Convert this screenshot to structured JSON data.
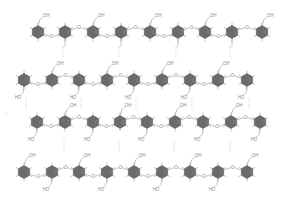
{
  "diagram": {
    "type": "chemical-structure",
    "colors": {
      "ring_fill": "#6b6b6b",
      "bond": "#b0b0b0",
      "label": "#8a8a8a",
      "background": "#ffffff"
    },
    "labels": {
      "hydroxyl_up": "OH",
      "hydroxyl_down": "HO",
      "ether_oxygen": "O",
      "ring_oxygen": "O"
    },
    "rows": [
      {
        "id": "row-1",
        "y": 32,
        "ring_x": [
          38,
          65,
          93,
          121,
          150,
          178,
          205,
          232,
          262
        ],
        "oh_positions": [
          0,
          2,
          4,
          6,
          8
        ],
        "oh_side": "top",
        "link_down_at": [
          1,
          3,
          5,
          7
        ]
      },
      {
        "id": "row-2",
        "y": 80,
        "ring_x": [
          24,
          52,
          79,
          107,
          134,
          162,
          190,
          218,
          247
        ],
        "oh_positions": [
          1,
          3,
          5,
          7
        ],
        "oh_side": "top",
        "ho_positions": [
          0,
          2,
          4,
          6,
          8
        ]
      },
      {
        "id": "row-3",
        "y": 122,
        "ring_x": [
          37,
          65,
          93,
          120,
          147,
          175,
          203,
          231,
          260
        ],
        "oh_positions": [
          1,
          3,
          5,
          7
        ],
        "oh_side": "top",
        "ho_positions": [
          0,
          2,
          4,
          6,
          8
        ]
      },
      {
        "id": "row-4",
        "y": 172,
        "ring_x": [
          24,
          52,
          79,
          107,
          134,
          162,
          190,
          218,
          247
        ],
        "oh_positions": [
          0,
          2,
          4,
          6,
          8
        ],
        "oh_side": "top",
        "ho_positions": [
          1,
          3,
          5,
          7
        ]
      }
    ]
  }
}
